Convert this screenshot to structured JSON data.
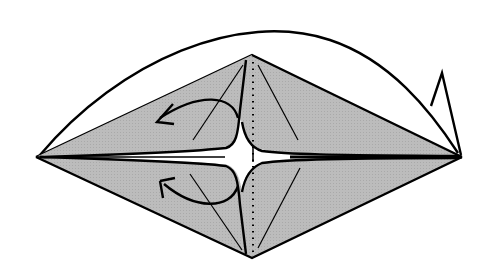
{
  "diagram": {
    "type": "origami-instruction",
    "colors": {
      "background": "#ffffff",
      "paper_fill": "#b8b8b8",
      "line": "#000000"
    },
    "shape": {
      "left_point": [
        36,
        157
      ],
      "right_point": [
        462,
        157
      ],
      "top_point": [
        252,
        55
      ],
      "bottom_point": [
        252,
        258
      ]
    },
    "elements": [
      {
        "name": "upper-half-diamond",
        "description": "shaded upper half of kite base"
      },
      {
        "name": "lower-half-diamond",
        "description": "shaded lower half of kite base"
      },
      {
        "name": "large-arc-flap",
        "description": "curved outline of back layer from left point to right point"
      },
      {
        "name": "small-triangle-flap",
        "description": "small pointed flap near right tip"
      },
      {
        "name": "center-dotted-line",
        "description": "vertical dotted valley/mountain fold line"
      },
      {
        "name": "upper-curved-arrow",
        "description": "arrow indicating flap folds to the left"
      },
      {
        "name": "lower-curved-arrow",
        "description": "arrow indicating flap folds to the left"
      }
    ]
  }
}
